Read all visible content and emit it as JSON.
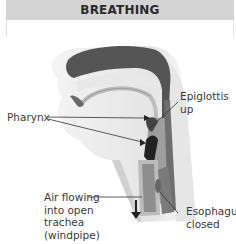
{
  "title": "BREATHING",
  "labels": {
    "pharynx": "Pharynx",
    "epiglottis": "Epiglottis\nup",
    "air": "Air flowing\ninto open\ntrachea\n(windpipe)",
    "esophagus": "Esophagus\nclosed"
  },
  "icons": {
    "airflow_arrow": "down-arrow-icon"
  },
  "colors": {
    "header_bg": "#d4d4d4",
    "header_text": "#2a2a2a",
    "label_text": "#3a3a3a",
    "leader_line": "#333333"
  }
}
